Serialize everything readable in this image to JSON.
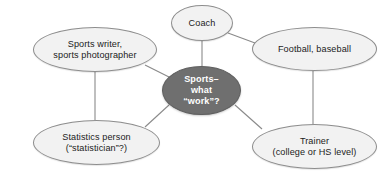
{
  "diagram": {
    "type": "concept-map",
    "colors": {
      "background": "#ffffff",
      "satellite_fill": "#f2f2f2",
      "satellite_border": "#8d8d8d",
      "center_fill": "#6f6f6f",
      "center_text": "#ffffff",
      "satellite_text": "#1b1b1b",
      "edge": "#8a8a8a"
    },
    "center_node": {
      "label": "Sports–\nwhat\n“work”?"
    },
    "nodes": [
      {
        "id": "sports-writer",
        "label": "Sports writer,\nsports photographer"
      },
      {
        "id": "coach",
        "label": "Coach"
      },
      {
        "id": "football-baseball",
        "label": "Football, baseball"
      },
      {
        "id": "statistics-person",
        "label": "Statistics person\n(“statistician”?)"
      },
      {
        "id": "trainer",
        "label": "Trainer\n(college or HS level)"
      }
    ],
    "edges": [
      {
        "from": "center",
        "to": "sports-writer"
      },
      {
        "from": "center",
        "to": "coach"
      },
      {
        "from": "center",
        "to": "statistics-person"
      },
      {
        "from": "center",
        "to": "trainer"
      },
      {
        "from": "coach",
        "to": "football-baseball"
      },
      {
        "from": "sports-writer",
        "to": "statistics-person"
      },
      {
        "from": "football-baseball",
        "to": "trainer"
      }
    ]
  }
}
